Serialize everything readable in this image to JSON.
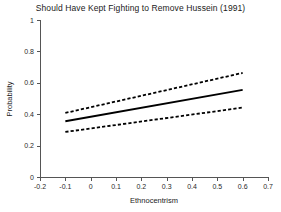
{
  "chart_data": {
    "type": "line",
    "title": "Should Have Kept Fighting to Remove Hussein (1991)",
    "xlabel": "Ethnocentrism",
    "ylabel": "Probability",
    "xlim": [
      -0.2,
      0.7
    ],
    "ylim": [
      0,
      1
    ],
    "xticks": [
      "-0.2",
      "-0.1",
      "0",
      "0.1",
      "0.2",
      "0.3",
      "0.4",
      "0.5",
      "0.6",
      "0.7"
    ],
    "xtick_values": [
      -0.2,
      -0.1,
      0,
      0.1,
      0.2,
      0.3,
      0.4,
      0.5,
      0.6,
      0.7
    ],
    "yticks": [
      "0",
      "0.2",
      "0.4",
      "0.6",
      "0.8",
      "1"
    ],
    "ytick_values": [
      0,
      0.2,
      0.4,
      0.6,
      0.8,
      1
    ],
    "grid": false,
    "legend": "none",
    "x": [
      -0.1,
      0.6
    ],
    "series": [
      {
        "name": "Predicted probability",
        "style": "solid",
        "values": [
          0.355,
          0.555
        ]
      },
      {
        "name": "Upper 95% confidence bound",
        "style": "dashed",
        "values": [
          0.408,
          0.663
        ]
      },
      {
        "name": "Lower 95% confidence bound",
        "style": "dashed",
        "values": [
          0.287,
          0.442
        ]
      }
    ],
    "colors": {
      "line": "#000000",
      "confidence": "#000000",
      "axis": "#555555",
      "background": "#ffffff"
    }
  }
}
